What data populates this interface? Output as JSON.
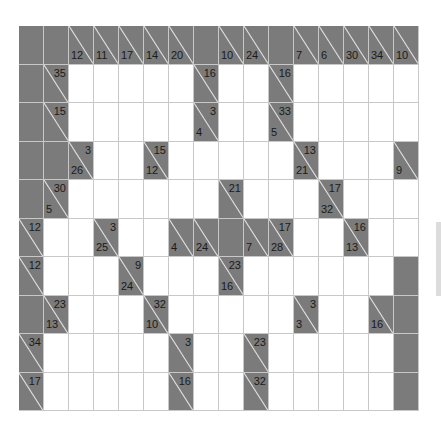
{
  "puzzle": {
    "type": "kakuro",
    "cols": 16,
    "rows": 10,
    "colors": {
      "dark": "#7b7b7b",
      "white": "#ffffff",
      "gridline": "#c8c8c8",
      "text": "#1a1a1a"
    },
    "grid": [
      [
        "D",
        "D",
        {
          "d": "12"
        },
        {
          "d": "11"
        },
        {
          "d": "17"
        },
        {
          "d": "14"
        },
        {
          "d": "20"
        },
        "D",
        {
          "d": "10"
        },
        {
          "d": "24"
        },
        "D",
        {
          "d": "7"
        },
        {
          "d": "6"
        },
        {
          "d": "30"
        },
        {
          "d": "34"
        },
        {
          "d": "10"
        }
      ],
      [
        "D",
        {
          "r": "35"
        },
        "W",
        "W",
        "W",
        "W",
        "W",
        {
          "r": "16"
        },
        "W",
        "W",
        {
          "r": "16"
        },
        "W",
        "W",
        "W",
        "W",
        "W"
      ],
      [
        "D",
        {
          "r": "15"
        },
        "W",
        "W",
        "W",
        "W",
        "W",
        {
          "r": "3",
          "d": "4"
        },
        "W",
        "W",
        {
          "r": "33",
          "d": "5"
        },
        "W",
        "W",
        "W",
        "W",
        "W"
      ],
      [
        "D",
        "D",
        {
          "r": "3",
          "d": "26"
        },
        "W",
        "W",
        {
          "r": "15",
          "d": "12"
        },
        "W",
        "W",
        "W",
        "W",
        "W",
        {
          "r": "13",
          "d": "21"
        },
        "W",
        "W",
        "W",
        {
          "d": "9"
        }
      ],
      [
        "D",
        {
          "r": "30",
          "d": "5"
        },
        "W",
        "W",
        "W",
        "W",
        "W",
        "W",
        {
          "r": "21"
        },
        "W",
        "W",
        "W",
        {
          "r": "17",
          "d": "32"
        },
        "W",
        "W",
        "W"
      ],
      [
        {
          "r": "12"
        },
        "W",
        "W",
        {
          "r": "3",
          "d": "25"
        },
        "W",
        "W",
        {
          "d": "4"
        },
        {
          "d": "24"
        },
        "D",
        {
          "d": "7"
        },
        {
          "r": "17",
          "d": "28"
        },
        "W",
        "W",
        {
          "r": "16",
          "d": "13"
        },
        "W",
        "W"
      ],
      [
        {
          "r": "12"
        },
        "W",
        "W",
        "W",
        {
          "r": "9",
          "d": "24"
        },
        "W",
        "W",
        "W",
        {
          "r": "23",
          "d": "16"
        },
        "W",
        "W",
        "W",
        "W",
        "W",
        "W",
        "D"
      ],
      [
        "D",
        {
          "r": "23",
          "d": "13"
        },
        "W",
        "W",
        "W",
        {
          "r": "32",
          "d": "10"
        },
        "W",
        "W",
        "W",
        "W",
        "W",
        {
          "r": "3",
          "d": "3"
        },
        "W",
        "W",
        {
          "d": "16"
        },
        "D"
      ],
      [
        {
          "r": "34"
        },
        "W",
        "W",
        "W",
        "W",
        "W",
        {
          "r": "3"
        },
        "W",
        "W",
        {
          "r": "23"
        },
        "W",
        "W",
        "W",
        "W",
        "W",
        "D"
      ],
      [
        {
          "r": "17"
        },
        "W",
        "W",
        "W",
        "W",
        "W",
        {
          "r": "16"
        },
        "W",
        "W",
        {
          "r": "32"
        },
        "W",
        "W",
        "W",
        "W",
        "W",
        "D"
      ]
    ]
  },
  "scrollbar": {
    "visible": true
  }
}
